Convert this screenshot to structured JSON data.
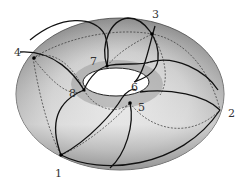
{
  "diagram": {
    "colors": {
      "surface_light": "#e8e8e8",
      "surface_dark": "#8a8a8a",
      "curve": "#111111",
      "dashed": "#333333",
      "label": "#333333"
    },
    "points": [
      {
        "label": "1",
        "x": 61,
        "y": 155,
        "lx": 55,
        "ly": 168
      },
      {
        "label": "2",
        "x": 220,
        "y": 110,
        "lx": 228,
        "ly": 108
      },
      {
        "label": "3",
        "x": 152,
        "y": 34,
        "lx": 152,
        "ly": 9
      },
      {
        "label": "4",
        "x": 33,
        "y": 58,
        "lx": 14,
        "ly": 47
      },
      {
        "label": "5",
        "x": 130,
        "y": 103,
        "lx": 138,
        "ly": 102
      },
      {
        "label": "6",
        "x": 130,
        "y": 92,
        "lx": 131,
        "ly": 82
      },
      {
        "label": "7",
        "x": 107,
        "y": 66,
        "lx": 90,
        "ly": 56
      },
      {
        "label": "8",
        "x": 84,
        "y": 90,
        "lx": 69,
        "ly": 88
      }
    ]
  }
}
